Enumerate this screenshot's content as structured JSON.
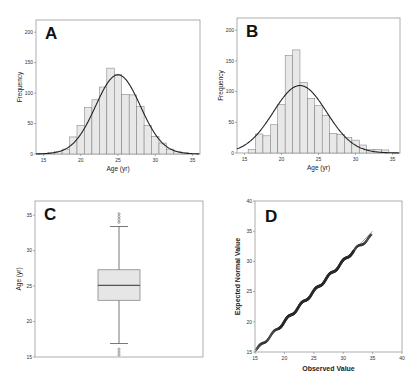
{
  "chart_data": [
    {
      "panel": "A",
      "type": "bar",
      "title": "A",
      "xlabel": "Age (yr)",
      "ylabel": "Frequency",
      "xlim": [
        14,
        36
      ],
      "ylim": [
        0,
        220
      ],
      "xticks": [
        15,
        20,
        25,
        30,
        35
      ],
      "yticks": [
        0,
        50,
        100,
        150,
        200
      ],
      "grid": false,
      "categories": [
        15,
        16,
        17,
        18,
        19,
        20,
        21,
        22,
        23,
        24,
        25,
        26,
        27,
        28,
        29,
        30,
        31,
        32,
        33,
        34
      ],
      "values": [
        1,
        2,
        4,
        8,
        28,
        47,
        76,
        89,
        110,
        141,
        131,
        98,
        97,
        78,
        47,
        29,
        18,
        8,
        4,
        2
      ],
      "overlay": {
        "type": "normal_curve",
        "mean": 25,
        "peak": 130
      }
    },
    {
      "panel": "B",
      "type": "bar",
      "title": "B",
      "xlabel": "Age (yr)",
      "ylabel": "Frequency",
      "xlim": [
        14,
        36
      ],
      "ylim": [
        0,
        220
      ],
      "xticks": [
        15,
        20,
        25,
        30,
        35
      ],
      "yticks": [
        0,
        50,
        100,
        150,
        200
      ],
      "grid": false,
      "categories": [
        16,
        17,
        18,
        19,
        20,
        21,
        22,
        23,
        24,
        25,
        26,
        27,
        28,
        29,
        30,
        31,
        32,
        33,
        34
      ],
      "values": [
        6,
        31,
        28,
        46,
        79,
        159,
        168,
        115,
        89,
        77,
        61,
        32,
        30,
        25,
        21,
        13,
        6,
        6,
        5
      ],
      "overlay": {
        "type": "normal_curve",
        "mean": 22.5,
        "peak": 110
      }
    },
    {
      "panel": "C",
      "type": "box",
      "title": "C",
      "ylabel": "Age (yr)",
      "ylim": [
        15,
        37
      ],
      "yticks": [
        15,
        20,
        25,
        30,
        35
      ],
      "q1": 23.0,
      "median": 25.1,
      "q3": 27.3,
      "whisker_low": 16.9,
      "whisker_high": 33.4,
      "outliers_high": [
        34.0,
        34.4,
        34.8,
        35.2
      ],
      "outliers_low": [
        15.3,
        15.7,
        16.1
      ]
    },
    {
      "panel": "D",
      "type": "scatter",
      "title": "D",
      "xlabel": "Observed Value",
      "ylabel": "Expected Normal Value",
      "xlim": [
        15,
        40
      ],
      "ylim": [
        15,
        40
      ],
      "xticks": [
        15,
        20,
        25,
        30,
        35,
        40
      ],
      "yticks": [
        15,
        20,
        25,
        30,
        35,
        40
      ],
      "reference_line": {
        "from": [
          15,
          15
        ],
        "to": [
          35,
          35
        ]
      },
      "points_range": {
        "x": [
          15.2,
          34.8
        ],
        "y": [
          15.2,
          35.1
        ]
      }
    }
  ],
  "labels": {
    "A": "A",
    "B": "B",
    "C": "C",
    "D": "D",
    "age_axis": "Age (yr)",
    "freq_axis": "Frequency",
    "observed": "Observed Value",
    "expected": "Expected Normal Value"
  }
}
